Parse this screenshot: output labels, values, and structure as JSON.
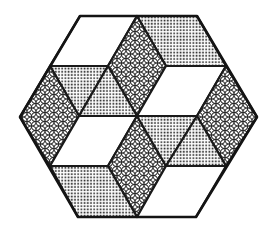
{
  "figure": {
    "colors": {
      "background": "#ffffff",
      "stroke": "#1a1a1a",
      "white_fill": "#ffffff",
      "dot_ink": "#2a2a2a",
      "pattern_ink": "#2a2a2a"
    },
    "fills": [
      "white",
      "dotted",
      "circle-lattice"
    ],
    "hexagon": {
      "vertices": [
        [
          80,
          16
        ],
        [
          197,
          16
        ],
        [
          257,
          117
        ],
        [
          196,
          217
        ],
        [
          78,
          217
        ],
        [
          20,
          117
        ]
      ]
    },
    "tiles": [
      {
        "name": "top-left-rhombus",
        "fill": "white",
        "points": "80,16 137,16 108,66 50,66"
      },
      {
        "name": "top-right-rhombus",
        "fill": "dotted",
        "points": "137,16 197,16 226,66 166,66"
      },
      {
        "name": "top-center-rhombus",
        "fill": "circle-lattice",
        "points": "137,16 166,66 137,116 108,66"
      },
      {
        "name": "upper-left-triangle-a",
        "fill": "dotted",
        "points": "50,66 108,66 79,116"
      },
      {
        "name": "upper-left-triangle-b",
        "fill": "dotted",
        "points": "108,66 137,116 79,116"
      },
      {
        "name": "left-rhombus",
        "fill": "circle-lattice",
        "points": "50,66 79,116 50,166 20,117"
      },
      {
        "name": "upper-right-rhombus",
        "fill": "white",
        "points": "166,66 226,66 197,116 137,116"
      },
      {
        "name": "right-rhombus",
        "fill": "circle-lattice",
        "points": "226,66 257,117 226,166 197,116"
      },
      {
        "name": "lower-left-rhombus",
        "fill": "white",
        "points": "79,116 137,116 108,166 50,166"
      },
      {
        "name": "bottom-center-rhombus",
        "fill": "circle-lattice",
        "points": "137,116 166,166 137,217 108,166"
      },
      {
        "name": "lower-right-triangle-a",
        "fill": "dotted",
        "points": "137,116 197,116 166,166"
      },
      {
        "name": "lower-right-triangle-b",
        "fill": "dotted",
        "points": "197,116 226,166 166,166"
      },
      {
        "name": "bottom-left-rhombus",
        "fill": "dotted",
        "points": "50,166 108,166 137,217 78,217"
      },
      {
        "name": "bottom-right-rhombus",
        "fill": "white",
        "points": "166,166 226,166 196,217 137,217"
      }
    ]
  }
}
